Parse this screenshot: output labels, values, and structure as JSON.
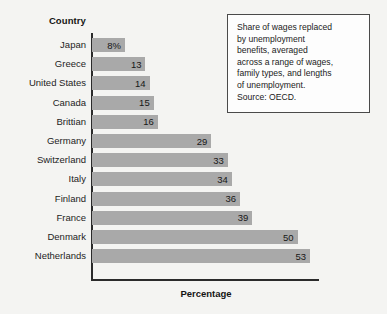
{
  "chart_data": {
    "type": "bar",
    "orientation": "horizontal",
    "title": "",
    "xlabel": "Percentage",
    "ylabel": "Country",
    "categories": [
      "Japan",
      "Greece",
      "United States",
      "Canada",
      "Brittian",
      "Germany",
      "Switzerland",
      "Italy",
      "Finland",
      "France",
      "Denmark",
      "Netherlands"
    ],
    "values": [
      8,
      13,
      14,
      15,
      16,
      29,
      33,
      34,
      36,
      39,
      50,
      53
    ],
    "value_labels": [
      "8%",
      "13",
      "14",
      "15",
      "16",
      "29",
      "33",
      "34",
      "36",
      "39",
      "50",
      "53"
    ],
    "xlim": [
      0,
      53
    ],
    "grid": false,
    "legend": null,
    "bar_color": "#a9a9a9",
    "axis_color": "#2b2b2b",
    "annotation": "Share of wages replaced\nby unemployment\nbenefits, averaged\nacross a range of wages,\nfamily types, and lengths\nof unemployment.\nSource: OECD."
  },
  "axes": {
    "y_title": "Country",
    "x_title": "Percentage"
  }
}
